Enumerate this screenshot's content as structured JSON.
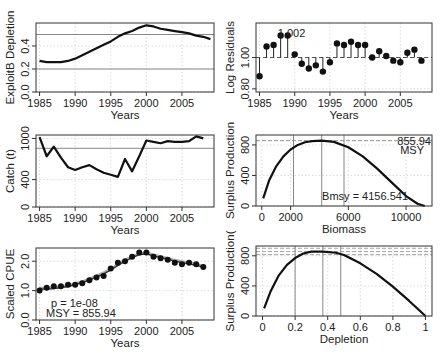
{
  "chart_data": [
    {
      "id": "exploitable-depletion",
      "type": "line",
      "xlabel": "Years",
      "ylabel": "ExploitB Depletion",
      "xticks": [
        1985,
        1990,
        1995,
        2000,
        2005
      ],
      "yticks": [
        0.0,
        0.2,
        0.4
      ],
      "xlim": [
        1984.5,
        2009.5
      ],
      "ylim": [
        0.0,
        0.6
      ],
      "grid": true,
      "ref_lines": [
        0.5,
        0.2
      ],
      "x": [
        1985,
        1986,
        1987,
        1988,
        1989,
        1990,
        1991,
        1992,
        1993,
        1994,
        1995,
        1996,
        1997,
        1998,
        1999,
        2000,
        2001,
        2002,
        2003,
        2004,
        2005,
        2006,
        2007,
        2008,
        2009
      ],
      "values": [
        0.27,
        0.26,
        0.26,
        0.26,
        0.27,
        0.29,
        0.32,
        0.35,
        0.38,
        0.41,
        0.44,
        0.48,
        0.51,
        0.53,
        0.56,
        0.58,
        0.57,
        0.55,
        0.54,
        0.53,
        0.52,
        0.51,
        0.49,
        0.48,
        0.46
      ]
    },
    {
      "id": "log-residuals",
      "type": "scatter",
      "xlabel": "Years",
      "ylabel": "Log Residuals",
      "xticks": [
        1985,
        1990,
        1995,
        2000,
        2005
      ],
      "yticks": [
        0.8,
        1.0
      ],
      "xlim": [
        1984.5,
        2009.5
      ],
      "ylim": [
        0.78,
        1.22
      ],
      "grid": true,
      "baseline": 1.0,
      "annotation": "1.002",
      "x": [
        1985,
        1986,
        1987,
        1988,
        1989,
        1990,
        1991,
        1992,
        1993,
        1994,
        1995,
        1996,
        1997,
        1998,
        1999,
        2000,
        2001,
        2002,
        2003,
        2004,
        2005,
        2006,
        2007,
        2008
      ],
      "values": [
        0.88,
        1.07,
        1.08,
        1.14,
        1.14,
        1.02,
        0.96,
        0.93,
        0.95,
        0.91,
        0.97,
        1.09,
        1.08,
        1.1,
        1.08,
        1.08,
        1.0,
        1.04,
        1.01,
        0.98,
        0.97,
        1.03,
        1.05,
        0.98
      ]
    },
    {
      "id": "catch",
      "type": "line",
      "xlabel": "Years",
      "ylabel": "Catch (t)",
      "xticks": [
        1985,
        1990,
        1995,
        2000,
        2005
      ],
      "yticks": [
        0,
        400,
        1000
      ],
      "xlim": [
        1984.5,
        2009.5
      ],
      "ylim": [
        0,
        1050
      ],
      "grid": true,
      "ref_lines": [
        855.94
      ],
      "x": [
        1985,
        1986,
        1987,
        1988,
        1989,
        1990,
        1991,
        1992,
        1993,
        1994,
        1995,
        1996,
        1997,
        1998,
        1999,
        2000,
        2001,
        2002,
        2003,
        2004,
        2005,
        2006,
        2007,
        2008
      ],
      "values": [
        1020,
        740,
        880,
        720,
        580,
        540,
        580,
        610,
        550,
        500,
        470,
        440,
        700,
        520,
        740,
        970,
        950,
        930,
        960,
        950,
        950,
        960,
        1030,
        1000
      ]
    },
    {
      "id": "surplus-vs-biomass",
      "type": "line",
      "xlabel": "Biomass",
      "ylabel": "Surplus Production",
      "xticks": [
        0,
        2000,
        6000,
        10000
      ],
      "yticks": [
        0,
        400,
        800
      ],
      "xlim": [
        -400,
        11800
      ],
      "ylim": [
        0,
        930
      ],
      "grid": true,
      "msy": 855.94,
      "bmsy": 4156.541,
      "vlines": [
        2200,
        4156.541,
        5700
      ],
      "annotations": [
        "855.94",
        "MSY",
        "Bmsy = 4156.541"
      ],
      "x": [
        100,
        500,
        1000,
        1500,
        2000,
        2500,
        3000,
        3500,
        4156,
        5000,
        6000,
        7000,
        8000,
        9000,
        10000,
        10800,
        11300
      ],
      "values": [
        100,
        330,
        520,
        650,
        740,
        800,
        835,
        850,
        856,
        840,
        770,
        650,
        490,
        310,
        130,
        30,
        0
      ]
    },
    {
      "id": "scaled-cpue",
      "type": "scatter",
      "xlabel": "Years",
      "ylabel": "Scaled CPUE",
      "xticks": [
        1985,
        1990,
        1995,
        2000,
        2005
      ],
      "yticks": [
        0.0,
        1.0,
        2.0
      ],
      "xlim": [
        1984.5,
        2009.5
      ],
      "ylim": [
        0.0,
        2.45
      ],
      "grid": true,
      "annotations": [
        "p = 1e-08",
        "MSY = 855.94"
      ],
      "x": [
        1985,
        1986,
        1987,
        1988,
        1989,
        1990,
        1991,
        1992,
        1993,
        1994,
        1995,
        1996,
        1997,
        1998,
        1999,
        2000,
        2001,
        2002,
        2003,
        2004,
        2005,
        2006,
        2007,
        2008
      ],
      "observed": [
        1.0,
        1.1,
        1.15,
        1.15,
        1.2,
        1.2,
        1.25,
        1.35,
        1.45,
        1.5,
        1.75,
        1.95,
        2.0,
        2.15,
        2.3,
        2.3,
        2.15,
        2.1,
        2.05,
        1.95,
        1.9,
        1.95,
        1.9,
        1.8
      ],
      "fitted": [
        1.05,
        1.05,
        1.07,
        1.1,
        1.14,
        1.2,
        1.27,
        1.36,
        1.46,
        1.57,
        1.7,
        1.86,
        2.0,
        2.12,
        2.22,
        2.25,
        2.18,
        2.12,
        2.06,
        2.0,
        1.95,
        1.91,
        1.86,
        1.8
      ]
    },
    {
      "id": "surplus-vs-depletion",
      "type": "line",
      "xlabel": "Depletion",
      "ylabel": "Surplus Production(",
      "xticks": [
        0.0,
        0.2,
        0.4,
        0.6,
        0.8,
        1.0
      ],
      "yticks": [
        0,
        400,
        800
      ],
      "xlim": [
        -0.04,
        1.04
      ],
      "ylim": [
        0,
        930
      ],
      "grid": true,
      "vlines": [
        0.2,
        0.37,
        0.48
      ],
      "hlines": [
        900,
        855.94,
        815
      ],
      "x": [
        0.01,
        0.05,
        0.1,
        0.15,
        0.2,
        0.25,
        0.3,
        0.37,
        0.45,
        0.5,
        0.6,
        0.7,
        0.8,
        0.9,
        0.95,
        1.0
      ],
      "values": [
        100,
        330,
        540,
        680,
        770,
        830,
        855,
        856,
        840,
        810,
        700,
        560,
        390,
        200,
        100,
        0
      ]
    }
  ]
}
